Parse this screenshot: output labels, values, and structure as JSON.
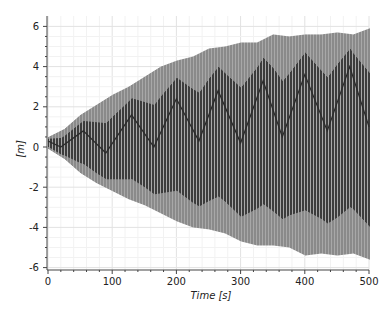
{
  "chart_data": {
    "type": "line",
    "title": "",
    "xlabel": "Time [s]",
    "ylabel": "[m]",
    "xlim": [
      0,
      500
    ],
    "ylim": [
      -6.5,
      6.5
    ],
    "x_ticks": [
      0,
      100,
      200,
      300,
      400,
      500
    ],
    "x_tick_labels": [
      "0",
      "100",
      "200",
      "300",
      "400",
      "500"
    ],
    "y_ticks": [
      -6,
      -4,
      -2,
      0,
      2,
      4,
      6
    ],
    "y_tick_labels": [
      "-6",
      "-4",
      "-2",
      "0",
      "2",
      "4",
      "6"
    ],
    "grid": true,
    "legend": null,
    "envelope": {
      "t": [
        0,
        25,
        50,
        75,
        100,
        125,
        150,
        175,
        200,
        225,
        250,
        275,
        300,
        325,
        350,
        375,
        400,
        425,
        450,
        475,
        500
      ],
      "upper": [
        0.5,
        0.9,
        1.6,
        2.1,
        2.6,
        3.0,
        3.5,
        4.0,
        4.3,
        4.5,
        4.9,
        5.0,
        5.2,
        5.2,
        5.6,
        5.5,
        5.6,
        5.6,
        5.7,
        5.6,
        5.9
      ],
      "lower": [
        -0.1,
        -0.6,
        -1.3,
        -1.8,
        -2.2,
        -2.6,
        -2.9,
        -3.3,
        -3.7,
        -4.0,
        -4.1,
        -4.3,
        -4.7,
        -4.9,
        -4.9,
        -5.0,
        -5.4,
        -5.3,
        -5.4,
        -5.3,
        -5.6
      ]
    },
    "beat_line": {
      "t": [
        0,
        20,
        55,
        90,
        130,
        165,
        200,
        235,
        265,
        300,
        335,
        365,
        400,
        435,
        470,
        500
      ],
      "value": [
        0.3,
        0.0,
        0.8,
        -0.3,
        1.6,
        0.0,
        2.4,
        0.3,
        2.8,
        0.2,
        3.3,
        0.5,
        3.6,
        0.8,
        4.0,
        1.0
      ]
    }
  },
  "colors": {
    "dark_stripe": "#3c3c3c",
    "light_stripe": "#8a8a8a",
    "light_band": "#a8a8a8",
    "grid_major": "#e2e2e2",
    "grid_minor": "#f2f2f2",
    "axis": "#444444"
  }
}
